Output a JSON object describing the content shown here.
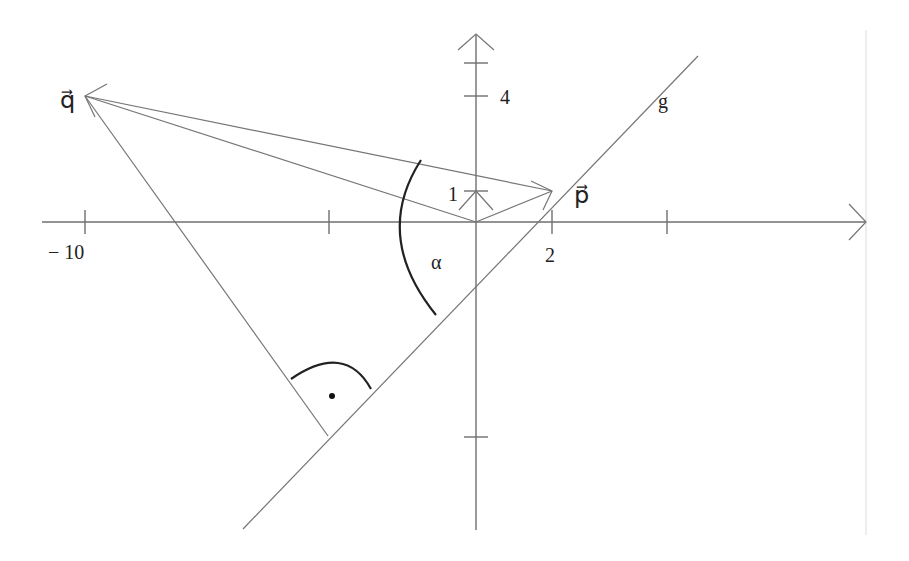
{
  "figure": {
    "type": "vector-geometry-diagram",
    "axes": {
      "x_tick_labels": [
        "− 10",
        "2"
      ],
      "y_tick_labels": [
        "4",
        "1"
      ]
    },
    "labels": {
      "vector_q": "q⃗",
      "vector_p": "p⃗",
      "line_g": "g",
      "angle": "α",
      "right_angle_dot": "·"
    },
    "elements": [
      {
        "name": "vector p",
        "from": [
          0,
          0
        ],
        "to": [
          2,
          1
        ]
      },
      {
        "name": "vector q",
        "from": [
          0,
          0
        ],
        "to": [
          -10,
          4
        ]
      },
      {
        "name": "difference vector",
        "from": [
          -10,
          4
        ],
        "to": [
          2,
          1
        ]
      },
      {
        "name": "line g",
        "through": [
          2,
          1
        ],
        "direction": "slope ~ 1"
      },
      {
        "name": "perpendicular from q to g",
        "from": [
          -10,
          4
        ]
      },
      {
        "name": "angle alpha",
        "between": [
          "q - p",
          "g"
        ]
      }
    ],
    "colors": {
      "lines": "#757575",
      "arcs": "#222222",
      "text": "#222222"
    }
  }
}
